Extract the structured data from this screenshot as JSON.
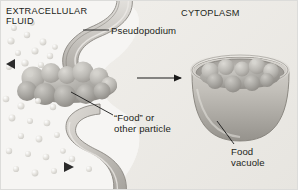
{
  "figure": {
    "background_color": "#f2f2f0",
    "labels": {
      "extracellular_fluid": "EXTRACELLULAR\nFLUID",
      "cytoplasm": "CYTOPLASM",
      "pseudopodium": "Pseudopodium",
      "food_particle": "“Food” or\nother particle",
      "food_vacuole": "Food\nvacuole"
    },
    "colors": {
      "membrane_fill": "#cfcdc8",
      "membrane_edge": "#8d8a84",
      "cytoplasm_fill": "#eceae6",
      "extracellular_fill": "#f4f4f2",
      "particle_fill": "#a9a7a2",
      "particle_highlight": "#c9c7c2",
      "vacuole_fill": "#bcb9b4",
      "vacuole_rim": "#d6d3ce",
      "solute_dot": "#dedcd7",
      "arrow_black": "#1a1a1a",
      "leader_line": "#1a1a1a",
      "text": "#231f20"
    },
    "elements": {
      "upper_pseudopodium": "curved membrane arm extending from right into extracellular fluid",
      "lower_pseudopodium": "curved membrane arm below the food particle",
      "food_particle_left": "lumpy gray multi-lobed particle being engulfed",
      "food_vacuole_right": "open bowl-shaped vacuole containing the lumpy particle",
      "process_arrow": "black horizontal arrow pointing right from engulfment to vacuole",
      "flow_triangle_upper_left": "small dark triangle pointing left",
      "flow_triangle_lower_mid": "small dark triangle pointing right"
    },
    "solute_dots_count": 31,
    "leader_lines": [
      {
        "name": "pseudopodium-leader",
        "from": [
          108,
          29
        ],
        "to": [
          82,
          29
        ]
      },
      {
        "name": "food-particle-leader",
        "from": [
          112,
          114
        ],
        "to": [
          72,
          92
        ]
      },
      {
        "name": "food-vacuole-leader",
        "from": [
          233,
          144
        ],
        "to": [
          216,
          121
        ]
      }
    ]
  }
}
